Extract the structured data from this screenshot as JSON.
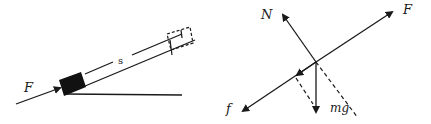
{
  "left_figure": {
    "force_label": "F",
    "displacement_label": "s",
    "description": "Block pushed up an incline by force F through displacement s"
  },
  "right_figure": {
    "labels": {
      "normal": "N",
      "applied": "F",
      "friction": "f",
      "weight": "mg"
    },
    "description": "Free-body diagram: N, F, f, mg with dashed weight components"
  },
  "colors": {
    "ink": "#1a1a1a",
    "background": "#ffffff"
  }
}
